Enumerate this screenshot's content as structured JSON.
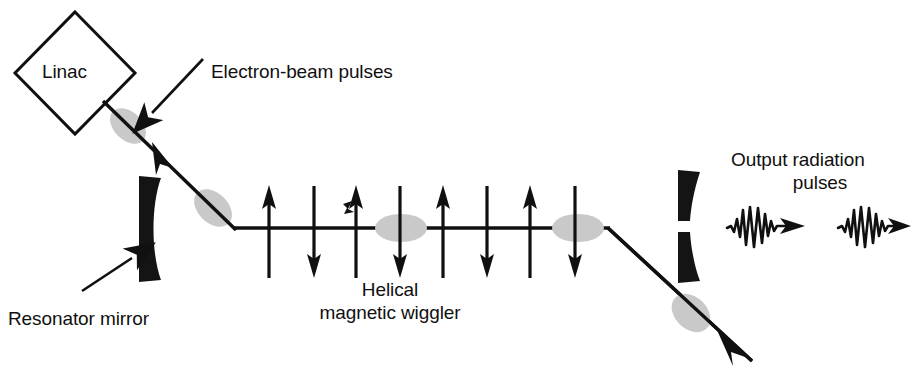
{
  "figure": {
    "title_alt": "Free-electron laser oscillator schematic",
    "background_color": "#ffffff",
    "ink_color": "#101010",
    "bunch_color": "#c9c9c9",
    "width": 917,
    "height": 375
  },
  "labels": {
    "linac": "Linac",
    "electron_beam_pulses": "Electron-beam pulses",
    "resonator_mirror": "Resonator mirror",
    "helical_line1": "Helical",
    "helical_line2": "magnetic wiggler",
    "output_line1": "Output radiation",
    "output_line2": "pulses"
  },
  "components": {
    "linac_shape": "diamond",
    "left_mirror": "concave-resonator-mirror",
    "right_mirror": "split-output-coupler-mirror",
    "wiggler_magnet_count": 8,
    "wiggler_arrow_directions": [
      "up",
      "down",
      "up",
      "down",
      "up",
      "down",
      "up",
      "down"
    ],
    "electron_bunch_count": 4,
    "output_pulse_count": 2
  },
  "geometry": {
    "linac_diamond": {
      "cx": 75,
      "cy": 73,
      "rx": 60,
      "ry": 61
    },
    "beam_in": {
      "x1": 105,
      "y1": 103,
      "x2": 233,
      "y2": 228
    },
    "beam_axis": {
      "x1": 233,
      "y1": 228,
      "x2": 608,
      "y2": 228
    },
    "beam_out": {
      "x1": 608,
      "y1": 228,
      "x2": 757,
      "y2": 366
    },
    "wiggler_arrow_x": [
      269,
      314,
      356,
      400,
      443,
      487,
      530,
      575
    ],
    "wiggler_arrow_top": 186,
    "wiggler_arrow_bottom": 278,
    "bunches": [
      {
        "cx": 128,
        "cy": 126,
        "rx": 21,
        "ry": 14,
        "rot": 44
      },
      {
        "cx": 213,
        "cy": 208,
        "rx": 22,
        "ry": 15,
        "rot": 44
      },
      {
        "cx": 401,
        "cy": 228,
        "rx": 26,
        "ry": 14,
        "rot": 0
      },
      {
        "cx": 578,
        "cy": 228,
        "rx": 26,
        "ry": 14,
        "rot": 0
      },
      {
        "cx": 691,
        "cy": 313,
        "rx": 22,
        "ry": 16,
        "rot": 44
      }
    ],
    "left_mirror": {
      "x": 138,
      "y_top": 176,
      "y_bottom": 282,
      "thickness": 22
    },
    "right_mirror": {
      "x": 678,
      "y_top": 170,
      "y_bottom": 283,
      "gap_top": 221,
      "gap_bottom": 232,
      "thickness": 22
    },
    "output_pulses": [
      {
        "x": 727,
        "y": 225
      },
      {
        "x": 838,
        "y": 225
      }
    ]
  },
  "text_positions": {
    "linac": {
      "x": 42,
      "y": 60
    },
    "electron_beam_pulses": {
      "x": 211,
      "y": 60
    },
    "resonator_mirror": {
      "x": 8,
      "y": 307
    },
    "helical": {
      "x": 364,
      "y": 278
    },
    "output": {
      "x": 731,
      "y": 148
    }
  }
}
